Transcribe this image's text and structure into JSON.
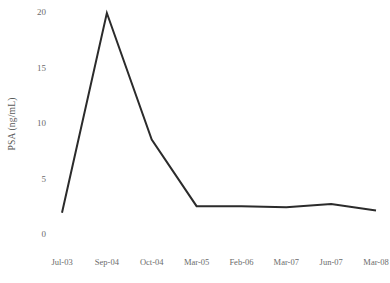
{
  "chart_data": {
    "type": "line",
    "title": "",
    "xlabel": "",
    "ylabel": "PSA (ng/mL)",
    "categories": [
      "Jul-03",
      "Sep-04",
      "Oct-04",
      "Mar-05",
      "Feb-06",
      "Mar-07",
      "Jun-07",
      "Mar-08"
    ],
    "values": [
      2.0,
      20.0,
      8.6,
      2.6,
      2.6,
      2.5,
      2.8,
      2.2
    ],
    "series": [
      {
        "name": "PSA",
        "values": [
          2.0,
          20.0,
          8.6,
          2.6,
          2.6,
          2.5,
          2.8,
          2.2
        ]
      }
    ],
    "ylim": [
      0,
      20
    ],
    "yticks": [
      0,
      5,
      10,
      15,
      20
    ],
    "ytick_labels": [
      "0",
      "5",
      "10",
      "15",
      "20"
    ],
    "xtick_labels": [
      "Jul-03",
      "Sep-04",
      "Oct-04",
      "Mar-05",
      "Feb-06",
      "Mar-07",
      "Jun-07",
      "Mar-08"
    ],
    "grid": false,
    "legend": false,
    "markers": false,
    "axis_lines": false,
    "line_color": "#2b2b2b",
    "tick_label_color": "#6b6b6b",
    "axis_title_color": "#595959",
    "background_color": "#ffffff"
  },
  "layout": {
    "plot_left_px": 62,
    "plot_right_px": 376,
    "y_value_20_px": 13,
    "y_value_0_px": 235
  }
}
